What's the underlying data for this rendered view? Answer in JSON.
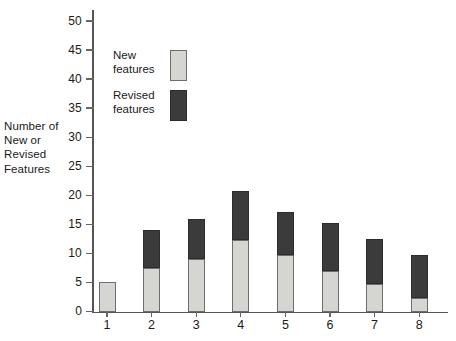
{
  "chart_data": {
    "type": "bar",
    "subtype": "stacked",
    "title": "",
    "xlabel": "",
    "ylabel": "Number of New or Revised Features",
    "ylabel_lines": [
      "Number of",
      "New or",
      "Revised",
      "Features"
    ],
    "categories": [
      "1",
      "2",
      "3",
      "4",
      "5",
      "6",
      "7",
      "8"
    ],
    "ylim": [
      0,
      50
    ],
    "ytick_labels": [
      "0",
      "5",
      "10",
      "15",
      "20",
      "25",
      "30",
      "35",
      "40",
      "45",
      "50"
    ],
    "ytick_values": [
      0,
      5,
      10,
      15,
      20,
      25,
      30,
      35,
      40,
      45,
      50
    ],
    "grid": false,
    "legend_position": "upper-left-inside",
    "series": [
      {
        "name": "New features",
        "name_lines": [
          "New",
          "features"
        ],
        "color": "#d5d5d1",
        "values": [
          5,
          7.5,
          9,
          12.3,
          9.7,
          6.9,
          4.8,
          2.4
        ]
      },
      {
        "name": "Revised features",
        "name_lines": [
          "Revised",
          "features"
        ],
        "color": "#3b3b3b",
        "values": [
          0,
          6.5,
          7,
          8.4,
          7.5,
          8.4,
          7.6,
          7.3
        ]
      }
    ],
    "totals": [
      5,
      14,
      16,
      20.7,
      17.2,
      15.3,
      12.4,
      9.7
    ]
  },
  "colors": {
    "new_features": "#d5d5d1",
    "revised_features": "#3b3b3b",
    "axis": "#555555",
    "text": "#1a1a1a",
    "background": "#ffffff"
  }
}
